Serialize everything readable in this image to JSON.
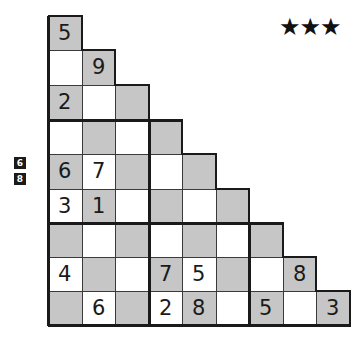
{
  "difficulty": {
    "label": "★★★",
    "stars": 3
  },
  "side_clues": [
    "6",
    "8"
  ],
  "grid": {
    "rows": 9,
    "shape": "staircase-triangle",
    "shading": "checkerboard (gray when row+col even)",
    "colors": {
      "gray": "#c6c6c6",
      "white": "#ffffff",
      "border": "#3a3a3a",
      "thick_border": "#1a1a1a"
    },
    "cells": [
      [
        "5"
      ],
      [
        "",
        "9"
      ],
      [
        "2",
        "",
        ""
      ],
      [
        "",
        "",
        "",
        ""
      ],
      [
        "6",
        "7",
        "",
        "",
        ""
      ],
      [
        "3",
        "1",
        "",
        "",
        "",
        ""
      ],
      [
        "",
        "",
        "",
        "",
        "",
        "",
        ""
      ],
      [
        "4",
        "",
        "",
        "7",
        "5",
        "",
        "",
        "8"
      ],
      [
        "",
        "6",
        "",
        "2",
        "8",
        "",
        "5",
        "",
        "3"
      ]
    ]
  }
}
